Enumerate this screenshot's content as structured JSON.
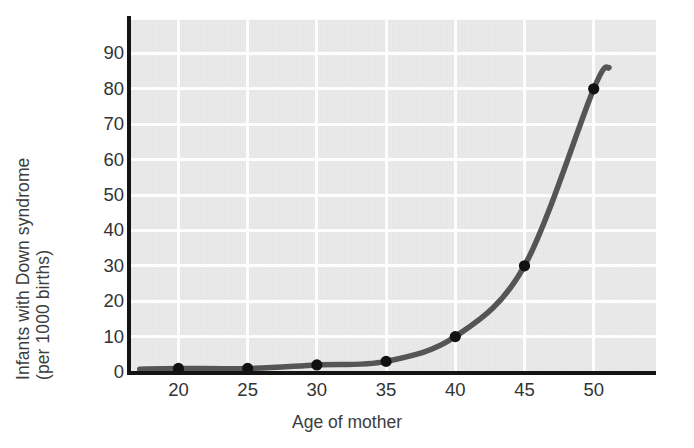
{
  "chart_data": {
    "type": "line",
    "title": "",
    "xlabel": "Age of mother",
    "ylabel_line1": "Infants with Down syndrome",
    "ylabel_line2": "(per 1000 births)",
    "x": [
      20,
      25,
      30,
      35,
      40,
      45,
      50
    ],
    "values": [
      1,
      1,
      2,
      3,
      10,
      30,
      80
    ],
    "series": [
      {
        "name": "Infants with Down syndrome per 1000 births",
        "values": [
          1,
          1,
          2,
          3,
          10,
          30,
          80
        ]
      }
    ],
    "xtick_labels": [
      "20",
      "25",
      "30",
      "35",
      "40",
      "45",
      "50"
    ],
    "ytick_labels": [
      "0",
      "10",
      "20",
      "30",
      "40",
      "50",
      "60",
      "70",
      "80",
      "90"
    ],
    "ytick_values": [
      0,
      10,
      20,
      30,
      40,
      50,
      60,
      70,
      80,
      90
    ],
    "xlim": [
      16.5,
      54.5
    ],
    "ylim": [
      0,
      100
    ],
    "grid": true,
    "grid_color": "#fdfdfd",
    "plot_background": "#e9e9e9",
    "line_color": "#555555",
    "marker_color": "#111111",
    "axis_color": "#141414",
    "legend": "none",
    "markers": [
      {
        "x": 20,
        "y": 1
      },
      {
        "x": 25,
        "y": 1
      },
      {
        "x": 30,
        "y": 2
      },
      {
        "x": 35,
        "y": 3
      },
      {
        "x": 40,
        "y": 10
      },
      {
        "x": 45,
        "y": 30
      },
      {
        "x": 50,
        "y": 80
      }
    ],
    "curve_extends_past_last_point_to": 86
  }
}
